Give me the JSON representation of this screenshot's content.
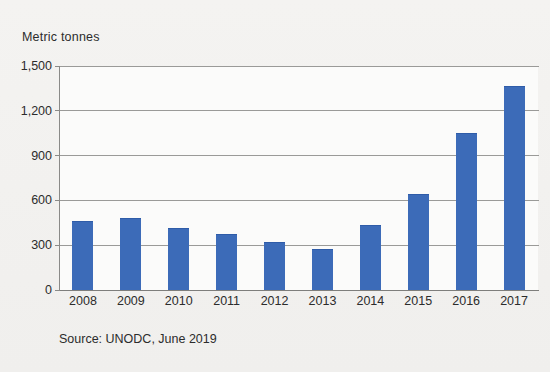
{
  "chart_data": {
    "type": "bar",
    "title": "",
    "ylabel": "Metric tonnes",
    "xlabel": "",
    "categories": [
      "2008",
      "2009",
      "2010",
      "2011",
      "2012",
      "2013",
      "2014",
      "2015",
      "2016",
      "2017"
    ],
    "values": [
      465,
      483,
      415,
      378,
      323,
      278,
      434,
      640,
      1050,
      1368
    ],
    "yticks": [
      "0",
      "300",
      "600",
      "900",
      "1,200",
      "1,500"
    ],
    "ytick_values": [
      0,
      300,
      600,
      900,
      1200,
      1500
    ],
    "ylim": [
      0,
      1500
    ],
    "grid": true,
    "legend": "none",
    "bar_color": "#3c6bb8",
    "background_color": "#f1f0ee",
    "annotations": [
      "Source: UNODC, June 2019"
    ]
  },
  "figure": {
    "axis_title": "Metric tonnes",
    "source": "Source: UNODC, June 2019"
  }
}
